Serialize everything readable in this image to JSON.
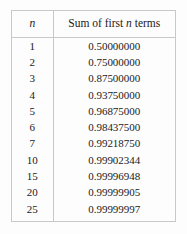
{
  "table": {
    "columns": [
      {
        "key": "n",
        "label_prefix": "",
        "label_var": "n",
        "label_suffix": ""
      },
      {
        "key": "sum",
        "label_prefix": "Sum of first ",
        "label_var": "n",
        "label_suffix": " terms"
      }
    ],
    "header": {
      "col1_var": "n",
      "col2_prefix": "Sum of first",
      "col2_var": "n",
      "col2_suffix": "terms"
    },
    "rows": [
      {
        "n": "1",
        "sum": "0.50000000"
      },
      {
        "n": "2",
        "sum": "0.75000000"
      },
      {
        "n": "3",
        "sum": "0.87500000"
      },
      {
        "n": "4",
        "sum": "0.93750000"
      },
      {
        "n": "5",
        "sum": "0.96875000"
      },
      {
        "n": "6",
        "sum": "0.98437500"
      },
      {
        "n": "7",
        "sum": "0.99218750"
      },
      {
        "n": "10",
        "sum": "0.99902344"
      },
      {
        "n": "15",
        "sum": "0.99996948"
      },
      {
        "n": "20",
        "sum": "0.99999905"
      },
      {
        "n": "25",
        "sum": "0.99999997"
      }
    ]
  },
  "style": {
    "background": "#fdfdfd",
    "border_color": "#c8c8c8",
    "text_color": "#1a1a1a"
  }
}
